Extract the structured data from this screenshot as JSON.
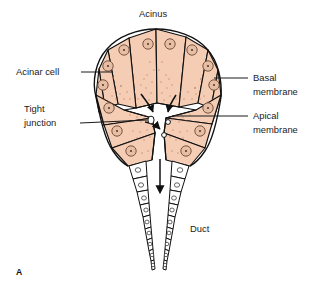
{
  "figure": {
    "panel_letter": "A",
    "title": "Acinus"
  },
  "labels": {
    "acinus": "Acinus",
    "acinar_cell": "Acinar cell",
    "tight_junction_line1": "Tight",
    "tight_junction_line2": "junction",
    "basal_membrane_line1": "Basal",
    "basal_membrane_line2": "membrane",
    "apical_membrane_line1": "Apical",
    "apical_membrane_line2": "membrane",
    "duct": "Duct"
  },
  "colors": {
    "cell_fill": "#f5cdb4",
    "cell_fill_light": "#f8dcc8",
    "outline": "#111111",
    "nucleus_fill": "#e7bda4",
    "nucleus_stroke": "#6b4a38",
    "stipple": "#b9745a",
    "duct_fill": "#ffffff",
    "text": "#1b1b1b",
    "background": "#ffffff"
  },
  "structure": {
    "acinar_cell_count": 14,
    "lumen_vesicle_count": 3,
    "secretion_arrow_count": 3,
    "duct_cell_rows": 2,
    "duct_cells_per_row": 9,
    "flow_direction": "downward"
  }
}
